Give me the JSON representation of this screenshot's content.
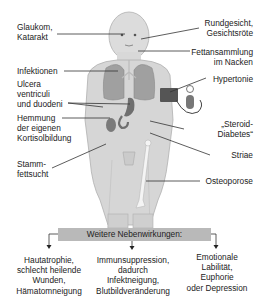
{
  "diagram": {
    "left_labels": [
      {
        "id": "glaukom",
        "lines": [
          "Glaukom,",
          "Katarakt"
        ]
      },
      {
        "id": "infektionen",
        "lines": [
          "Infektionen"
        ]
      },
      {
        "id": "ulcera",
        "lines": [
          "Ulcera",
          "ventriculi",
          "und duodeni"
        ]
      },
      {
        "id": "hemmung",
        "lines": [
          "Hemmung",
          "der eigenen",
          "Kortisolbildung"
        ]
      },
      {
        "id": "stammfettsucht",
        "lines": [
          "Stamm-",
          "fettsucht"
        ]
      }
    ],
    "right_labels": [
      {
        "id": "rundgesicht",
        "lines": [
          "Rundgesicht,",
          "Gesichtsröte"
        ]
      },
      {
        "id": "fettansammlung",
        "lines": [
          "Fettansammlung",
          "im Nacken"
        ]
      },
      {
        "id": "hypertonie",
        "lines": [
          "Hypertonie"
        ]
      },
      {
        "id": "steroid-diabetes",
        "lines": [
          "„Steroid-",
          "Diabetes“"
        ]
      },
      {
        "id": "striae",
        "lines": [
          "Striae"
        ]
      },
      {
        "id": "osteoporose",
        "lines": [
          "Osteoporose"
        ]
      }
    ],
    "box_label": "Weitere Nebenwirkungen:",
    "further_effects": [
      {
        "id": "haut",
        "lines": [
          "Hautatrophie,",
          "schlecht heilende",
          "Wunden,",
          "Hämatomneigung"
        ]
      },
      {
        "id": "immun",
        "lines": [
          "Immunsuppression,",
          "dadurch",
          "Infektneigung,",
          "Blutbildveränderung"
        ]
      },
      {
        "id": "emotional",
        "lines": [
          "Emotionale",
          "Labilität,",
          "Euphorie",
          "oder Depression"
        ]
      }
    ],
    "colors": {
      "body": "#d6d6d6",
      "body_outline": "#a8a8a8",
      "lungs": "#9a9a9a",
      "organs": "#6f6f6f",
      "box": "#b9b9b9",
      "lines": "#333333"
    }
  }
}
